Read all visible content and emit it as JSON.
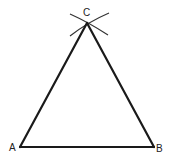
{
  "diagram": {
    "colors": {
      "stroke": "#1a1a1a",
      "arc": "#333333",
      "label": "#222222",
      "background": "#ffffff"
    },
    "vertices": [
      {
        "id": "A",
        "label": "A",
        "x": 20,
        "y": 147,
        "label_x": 9,
        "label_y": 151
      },
      {
        "id": "B",
        "label": "B",
        "x": 154,
        "y": 147,
        "label_x": 156,
        "label_y": 152
      },
      {
        "id": "C",
        "label": "C",
        "x": 87,
        "y": 23,
        "label_x": 83,
        "label_y": 16
      }
    ],
    "edges": [
      {
        "from": "A",
        "to": "B"
      },
      {
        "from": "B",
        "to": "C"
      },
      {
        "from": "C",
        "to": "A"
      }
    ],
    "arcs": [
      {
        "name": "arc-from-A",
        "d": "M70,14 Q88,22 108,35"
      },
      {
        "name": "arc-from-B",
        "d": "M70,36 Q88,22 109,13"
      }
    ]
  }
}
